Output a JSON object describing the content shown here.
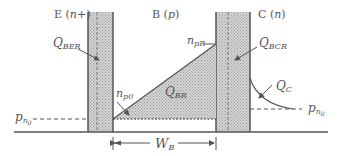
{
  "diagram": {
    "type": "bjt-minority-carrier-distribution",
    "regions": {
      "emitter": {
        "name": "E",
        "type": "n+",
        "label": "E (",
        "type_label": "n+",
        "close": ")"
      },
      "base": {
        "name": "B",
        "type": "p",
        "label": "B (",
        "type_label": "p",
        "close": ")"
      },
      "collector": {
        "name": "C",
        "type": "n",
        "label": "C (",
        "type_label": "n",
        "close": ")"
      }
    },
    "labels": {
      "q_ber": {
        "main": "Q",
        "sub": "BER"
      },
      "q_bcr": {
        "main": "Q",
        "sub": "BCR"
      },
      "q_br": {
        "main": "Q",
        "sub": "BR"
      },
      "q_c": {
        "main": "Q",
        "sub": "C"
      },
      "n_pr": {
        "main": "n",
        "sub": "pR"
      },
      "n_p0": {
        "main": "n",
        "sub": "p0"
      },
      "p_n0_left": {
        "main": "p",
        "sub": "n",
        "subsub": "0"
      },
      "p_n0_right": {
        "main": "p",
        "sub": "n",
        "subsub": "0"
      },
      "w_b": {
        "main": "W",
        "sub": "B"
      }
    },
    "colors": {
      "line": "#555555",
      "hatch_fill": "#c8c8c8",
      "background": "#ffffff"
    }
  }
}
